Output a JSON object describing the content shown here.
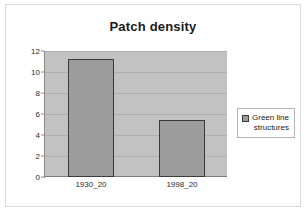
{
  "chart_data": {
    "type": "bar",
    "title": "Patch density",
    "categories": [
      "1930_20",
      "1998_20"
    ],
    "values": [
      11.2,
      5.4
    ],
    "series": [
      {
        "name": "Green line structures",
        "values": [
          11.2,
          5.4
        ]
      }
    ],
    "xlabel": "",
    "ylabel": "",
    "ylim": [
      0,
      12
    ],
    "yticks": [
      0,
      2,
      4,
      6,
      8,
      10,
      12
    ],
    "ytick_labels": [
      "0",
      "2",
      "4",
      "6",
      "8",
      "10",
      "12"
    ],
    "grid": true,
    "legend_position": "right",
    "legend_entries": [
      "Green line structures"
    ],
    "colors": {
      "bar_fill": "#9c9c9c",
      "bar_border": "#3b3b3b",
      "plot_background": "#c2c2c2",
      "gridline": "#aeaeae",
      "chart_background": "#ffffff",
      "frame_border": "#d9d9d9",
      "text": "#1a1a1a"
    }
  },
  "legend": {
    "swatch_name": "series-color-swatch",
    "label": "Green line\nstructures"
  }
}
